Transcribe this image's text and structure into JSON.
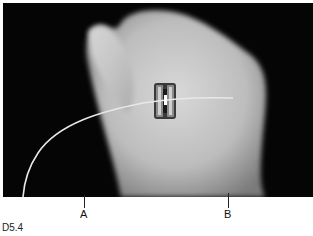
{
  "figure": {
    "id": "D5.4",
    "labels": [
      {
        "text": "A",
        "x": 84
      },
      {
        "text": "B",
        "x": 228
      }
    ]
  }
}
